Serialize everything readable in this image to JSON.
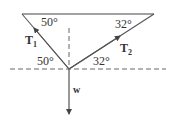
{
  "diagram": {
    "title": "",
    "colors": {
      "line": "#444444",
      "dash": "#666666",
      "text": "#333333",
      "background": "#ffffff"
    },
    "angles": {
      "top_left": "50°",
      "top_right": "32°",
      "bottom_left": "50°",
      "bottom_right": "32°"
    },
    "vectors": {
      "t1": {
        "label": "T",
        "subscript": "1"
      },
      "t2": {
        "label": "T",
        "subscript": "2"
      },
      "w": {
        "label": "w"
      }
    }
  }
}
